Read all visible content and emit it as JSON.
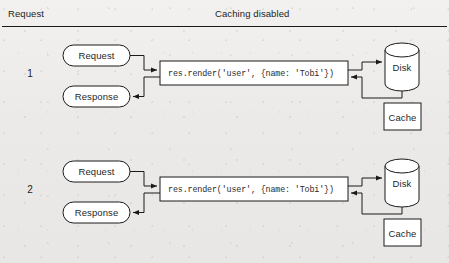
{
  "header": {
    "left_label": "Request",
    "center_label": "Caching disabled"
  },
  "code_snippet": "res.render('user', {name: 'Tobi'})",
  "labels": {
    "request": "Request",
    "response": "Response",
    "disk": "Disk",
    "cache": "Cache"
  },
  "rows": [
    {
      "number": "1",
      "request": "Request",
      "response": "Response",
      "code": "res.render('user', {name: 'Tobi'})",
      "disk": "Disk",
      "cache": "Cache"
    },
    {
      "number": "2",
      "request": "Request",
      "response": "Response",
      "code": "res.render('user', {name: 'Tobi'})",
      "disk": "Disk",
      "cache": "Cache"
    }
  ],
  "colors": {
    "background": "#edeceb",
    "stroke": "#1a1a1a",
    "shape_fill": "#ffffff",
    "text": "#1f1f1f"
  }
}
